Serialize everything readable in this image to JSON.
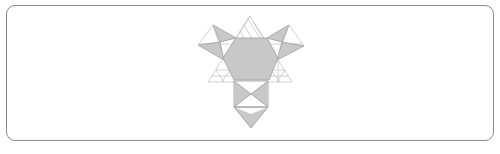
{
  "figure": {
    "colors": {
      "fill": "#c8c8c8",
      "stroke": "#9a9a9a",
      "thin_line": "#bdbdbd",
      "frame": "#8a8a8a",
      "background": "#ffffff"
    },
    "hexagon": [
      [
        236,
        38
      ],
      [
        267,
        38
      ],
      [
        278,
        58
      ],
      [
        269,
        80
      ],
      [
        234,
        80
      ],
      [
        223,
        58
      ]
    ],
    "big_triangle": [
      [
        250,
        16
      ],
      [
        208,
        82
      ],
      [
        292,
        82
      ]
    ],
    "left_kite": {
      "outline": [
        [
          213,
          25
        ],
        [
          236,
          38
        ],
        [
          224,
          60
        ],
        [
          198,
          45
        ]
      ],
      "grey": [
        [
          [
            213,
            25
          ],
          [
            236,
            38
          ],
          [
            220,
            42
          ]
        ],
        [
          [
            198,
            45
          ],
          [
            220,
            42
          ],
          [
            224,
            60
          ]
        ]
      ]
    },
    "right_kite": {
      "outline": [
        [
          289,
          25
        ],
        [
          304,
          46
        ],
        [
          277,
          60
        ],
        [
          267,
          38
        ]
      ],
      "grey": [
        [
          [
            267,
            38
          ],
          [
            289,
            25
          ],
          [
            282,
            42
          ]
        ],
        [
          [
            282,
            42
          ],
          [
            304,
            46
          ],
          [
            277,
            60
          ]
        ]
      ]
    },
    "square": [
      [
        234,
        81
      ],
      [
        268,
        81
      ],
      [
        268,
        107
      ],
      [
        234,
        107
      ]
    ],
    "bottom_triangle": [
      [
        234,
        107
      ],
      [
        268,
        107
      ],
      [
        251,
        128
      ]
    ]
  }
}
